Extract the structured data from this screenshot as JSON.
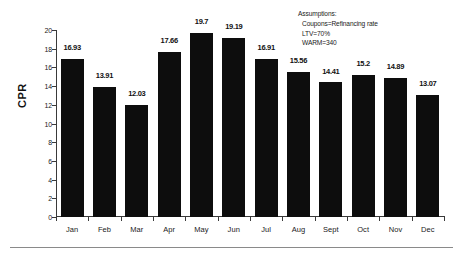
{
  "chart_data": {
    "type": "bar",
    "title": "",
    "subtitle": "",
    "xlabel": "",
    "ylabel": "CPR",
    "ylim": [
      0,
      20
    ],
    "ytick_step": 2,
    "yticks": [
      "20",
      "18",
      "16",
      "14",
      "12",
      "10",
      "8",
      "6",
      "4",
      "2",
      "0"
    ],
    "grid": false,
    "legend": "none",
    "bar_color": "#0d0d0d",
    "axis_color": "#3a3a3a",
    "categories": [
      "Jan",
      "Feb",
      "Mar",
      "Apr",
      "May",
      "Jun",
      "Jul",
      "Aug",
      "Sept",
      "Oct",
      "Nov",
      "Dec"
    ],
    "values": [
      16.93,
      13.91,
      12.03,
      17.66,
      19.7,
      19.19,
      16.91,
      15.56,
      14.41,
      15.2,
      14.89,
      13.07
    ],
    "value_labels": [
      "16.93",
      "13.91",
      "12.03",
      "17.66",
      "19.7",
      "19.19",
      "16.91",
      "15.56",
      "14.41",
      "15.2",
      "14.89",
      "13.07"
    ],
    "annotations": [
      "Assumptions:",
      "Coupons=Refinancing rate",
      "LTV=70%",
      "WARM=340"
    ]
  },
  "annotation": {
    "line1": "Assumptions:",
    "line2": "Coupons=Refinancing rate",
    "line3": "LTV=70%",
    "line4": "WARM=340"
  }
}
